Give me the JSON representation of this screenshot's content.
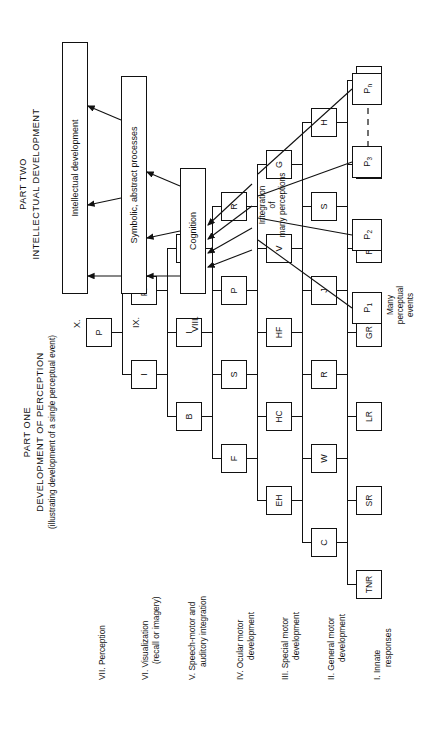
{
  "figure": {
    "orientation": "rotated-90-ccw",
    "ink_color": "#111111",
    "paper_color": "#ffffff"
  },
  "part_one": {
    "title_line1": "PART ONE",
    "title_line2": "DEVELOPMENT OF PERCEPTION",
    "title_line3": "(illustrating development of a single perceptual event)",
    "levels": [
      {
        "numeral": "VII.",
        "label_line1": "Perception",
        "label_line2": "",
        "nodes": [
          "P"
        ]
      },
      {
        "numeral": "VI.",
        "label_line1": "Visualization",
        "label_line2": "(recall or imagery)",
        "nodes": [
          "I",
          "PF"
        ]
      },
      {
        "numeral": "V.",
        "label_line1": "Speech-motor and",
        "label_line2": "auditory integration",
        "nodes": [
          "B",
          "I",
          "O"
        ]
      },
      {
        "numeral": "IV.",
        "label_line1": "Ocular motor",
        "label_line2": "development",
        "nodes": [
          "F",
          "S",
          "P",
          "R"
        ]
      },
      {
        "numeral": "III.",
        "label_line1": "Special motor",
        "label_line2": "development",
        "nodes": [
          "EH",
          "HC",
          "HF",
          "V",
          "G"
        ]
      },
      {
        "numeral": "II.",
        "label_line1": "General motor",
        "label_line2": "development",
        "nodes": [
          "C",
          "W",
          "R",
          "J",
          "S",
          "H"
        ]
      },
      {
        "numeral": "I.",
        "label_line1": "Innate",
        "label_line2": "responses",
        "nodes": [
          "TNR",
          "SR",
          "LR",
          "GR",
          "RR",
          "SKR",
          "MR"
        ]
      }
    ]
  },
  "part_two": {
    "title_line1": "PART TWO",
    "title_line2": "INTELLECTUAL DEVELOPMENT",
    "levels": [
      {
        "numeral": "X.",
        "label": "Intellectual development"
      },
      {
        "numeral": "IX.",
        "label": "Symbolic, abstract processes"
      },
      {
        "numeral": "VIII.",
        "label": "Cognition"
      }
    ],
    "integration_label_line1": "Integration",
    "integration_label_line2": "of",
    "integration_label_line3": "many perceptions",
    "events_label_line1": "Many",
    "events_label_line2": "perceptual",
    "events_label_line3": "events",
    "perception_nodes": [
      {
        "base": "P",
        "sub": "1"
      },
      {
        "base": "P",
        "sub": "2"
      },
      {
        "base": "P",
        "sub": "3"
      },
      {
        "base": "P",
        "sub": "n"
      }
    ]
  }
}
